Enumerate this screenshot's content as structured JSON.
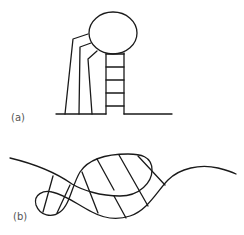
{
  "figure": {
    "panels": [
      {
        "id": "a",
        "label": "(a)",
        "description": "Stem-loop structure: circular loop atop a ladder-like stem, with three strands descending on the left to a baseline"
      },
      {
        "id": "b",
        "label": "(b)",
        "description": "Wavy strand forming a large hatched loop and a small hatched loop"
      }
    ],
    "stroke_color": "#1a1a1a",
    "label_color": "#555555",
    "background": "#ffffff"
  }
}
